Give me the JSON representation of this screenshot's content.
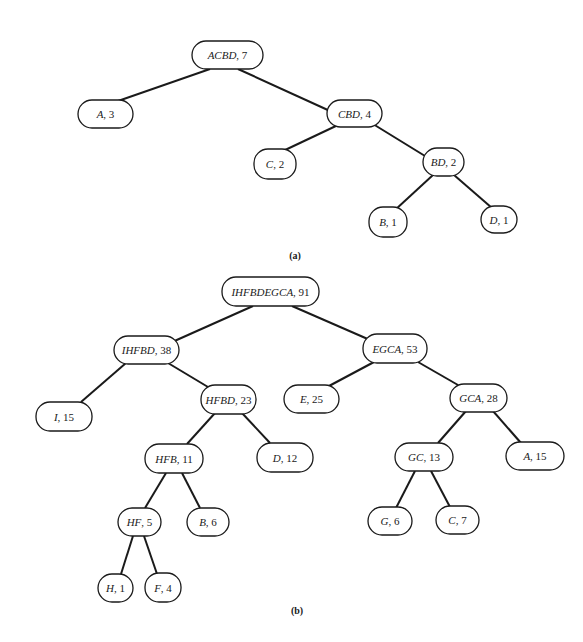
{
  "trees": [
    {
      "caption": "(a)",
      "caption_pos": [
        295,
        259
      ],
      "nodes": [
        {
          "id": "ACBD",
          "letters": "ACBD",
          "weight": "7",
          "box": [
            192,
            41,
            71,
            28
          ]
        },
        {
          "id": "A",
          "letters": "A",
          "weight": "3",
          "box": [
            78,
            100,
            55,
            28
          ]
        },
        {
          "id": "CBD",
          "letters": "CBD",
          "weight": "4",
          "box": [
            327,
            100,
            55,
            27
          ]
        },
        {
          "id": "C",
          "letters": "C",
          "weight": "2",
          "box": [
            254,
            149,
            42,
            30
          ]
        },
        {
          "id": "BD",
          "letters": "BD",
          "weight": "2",
          "box": [
            423,
            148,
            41,
            28
          ]
        },
        {
          "id": "B",
          "letters": "B",
          "weight": "1",
          "box": [
            369,
            207,
            38,
            30
          ]
        },
        {
          "id": "D",
          "letters": "D",
          "weight": "1",
          "box": [
            481,
            206,
            36,
            27
          ]
        }
      ],
      "edges": [
        {
          "from": "ACBD",
          "to": "A",
          "line": [
            210,
            69,
            118,
            101
          ]
        },
        {
          "from": "ACBD",
          "to": "CBD",
          "line": [
            238,
            69,
            330,
            111
          ]
        },
        {
          "from": "CBD",
          "to": "C",
          "line": [
            338,
            125,
            283,
            151
          ]
        },
        {
          "from": "CBD",
          "to": "BD",
          "line": [
            373,
            124,
            425,
            156
          ]
        },
        {
          "from": "BD",
          "to": "B",
          "line": [
            433,
            175,
            395,
            210
          ]
        },
        {
          "from": "BD",
          "to": "D",
          "line": [
            454,
            175,
            492,
            208
          ]
        }
      ]
    },
    {
      "caption": "(b)",
      "caption_pos": [
        297,
        614
      ],
      "nodes": [
        {
          "id": "IHFBDEGCA",
          "letters": "IHFBDEGCA",
          "weight": "91",
          "box": [
            222,
            277,
            97,
            29
          ]
        },
        {
          "id": "IHFBD",
          "letters": "IHFBD",
          "weight": "38",
          "box": [
            114,
            336,
            65,
            28
          ]
        },
        {
          "id": "EGCA",
          "letters": "EGCA",
          "weight": "53",
          "box": [
            363,
            334,
            64,
            29
          ]
        },
        {
          "id": "I",
          "letters": "I",
          "weight": "15",
          "box": [
            36,
            402,
            56,
            29
          ]
        },
        {
          "id": "HFBD",
          "letters": "HFBD",
          "weight": "23",
          "box": [
            201,
            385,
            55,
            29
          ]
        },
        {
          "id": "E",
          "letters": "E",
          "weight": "25",
          "box": [
            284,
            385,
            55,
            28
          ]
        },
        {
          "id": "GCA",
          "letters": "GCA",
          "weight": "28",
          "box": [
            450,
            384,
            57,
            28
          ]
        },
        {
          "id": "HFB",
          "letters": "HFB",
          "weight": "11",
          "box": [
            145,
            444,
            58,
            29
          ]
        },
        {
          "id": "D",
          "letters": "D",
          "weight": "12",
          "box": [
            257,
            443,
            56,
            29
          ]
        },
        {
          "id": "GC",
          "letters": "GC",
          "weight": "13",
          "box": [
            395,
            443,
            58,
            28
          ]
        },
        {
          "id": "A",
          "letters": "A",
          "weight": "15",
          "box": [
            506,
            442,
            58,
            28
          ]
        },
        {
          "id": "HF",
          "letters": "HF",
          "weight": "5",
          "box": [
            118,
            508,
            43,
            28
          ]
        },
        {
          "id": "B",
          "letters": "B",
          "weight": "6",
          "box": [
            187,
            508,
            42,
            28
          ]
        },
        {
          "id": "G",
          "letters": "G",
          "weight": "6",
          "box": [
            368,
            507,
            44,
            28
          ]
        },
        {
          "id": "C",
          "letters": "C",
          "weight": "7",
          "box": [
            436,
            506,
            43,
            28
          ]
        },
        {
          "id": "H",
          "letters": "H",
          "weight": "1",
          "box": [
            98,
            574,
            35,
            28
          ]
        },
        {
          "id": "F",
          "letters": "F",
          "weight": "4",
          "box": [
            145,
            573,
            36,
            29
          ]
        }
      ],
      "edges": [
        {
          "from": "IHFBDEGCA",
          "to": "IHFBD",
          "line": [
            253,
            306,
            170,
            343
          ]
        },
        {
          "from": "IHFBDEGCA",
          "to": "EGCA",
          "line": [
            292,
            306,
            370,
            340
          ]
        },
        {
          "from": "IHFBD",
          "to": "I",
          "line": [
            126,
            363,
            81,
            402
          ]
        },
        {
          "from": "IHFBD",
          "to": "HFBD",
          "line": [
            168,
            363,
            208,
            387
          ]
        },
        {
          "from": "EGCA",
          "to": "E",
          "line": [
            374,
            362,
            329,
            386
          ]
        },
        {
          "from": "EGCA",
          "to": "GCA",
          "line": [
            418,
            362,
            458,
            385
          ]
        },
        {
          "from": "HFBD",
          "to": "HFB",
          "line": [
            215,
            413,
            187,
            444
          ]
        },
        {
          "from": "HFBD",
          "to": "D",
          "line": [
            242,
            413,
            270,
            443
          ]
        },
        {
          "from": "GCA",
          "to": "GC",
          "line": [
            466,
            411,
            438,
            443
          ]
        },
        {
          "from": "GCA",
          "to": "A",
          "line": [
            493,
            411,
            521,
            443
          ]
        },
        {
          "from": "HFB",
          "to": "HF",
          "line": [
            166,
            473,
            145,
            508
          ]
        },
        {
          "from": "HFB",
          "to": "B",
          "line": [
            182,
            473,
            200,
            508
          ]
        },
        {
          "from": "GC",
          "to": "G",
          "line": [
            415,
            471,
            396,
            508
          ]
        },
        {
          "from": "GC",
          "to": "C",
          "line": [
            431,
            471,
            450,
            507
          ]
        },
        {
          "from": "HF",
          "to": "H",
          "line": [
            133,
            536,
            121,
            574
          ]
        },
        {
          "from": "HF",
          "to": "F",
          "line": [
            144,
            536,
            157,
            574
          ]
        }
      ]
    }
  ]
}
